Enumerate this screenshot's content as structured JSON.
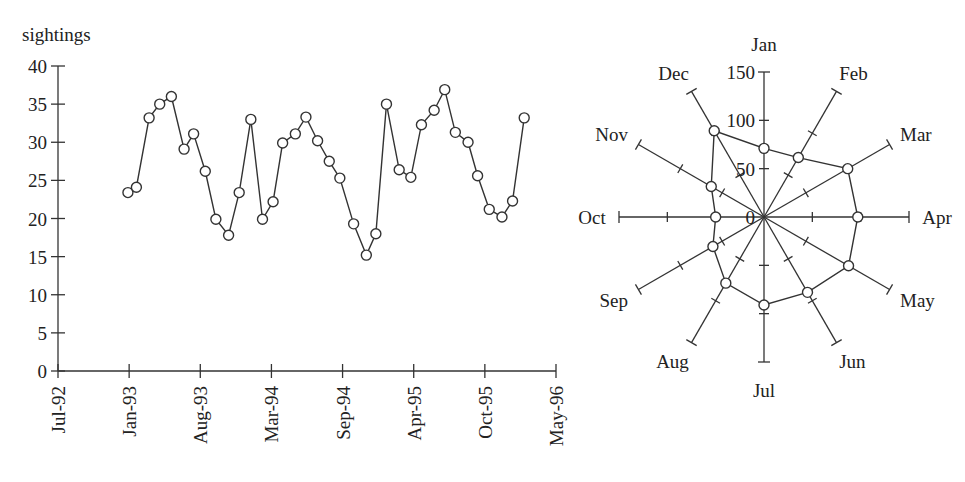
{
  "chart_data": [
    {
      "type": "line",
      "ylabel": "sightings",
      "xlabel": "",
      "title": "",
      "ylim": [
        0,
        40
      ],
      "yticks": [
        0,
        5,
        10,
        15,
        20,
        25,
        30,
        35,
        40
      ],
      "xtick_labels": [
        "Jul-92",
        "Jan-93",
        "Aug-93",
        "Mar-94",
        "Sep-94",
        "Apr-95",
        "Oct-95",
        "May-96"
      ],
      "xlim_months": [
        0,
        47
      ],
      "grid": false,
      "marker": "open-circle",
      "series": [
        {
          "name": "sightings",
          "x_months_since_jul92": [
            6.6,
            7.4,
            8.6,
            9.6,
            10.7,
            11.9,
            12.8,
            13.9,
            14.9,
            16.1,
            17.1,
            18.2,
            19.3,
            20.3,
            21.2,
            22.4,
            23.4,
            24.5,
            25.6,
            26.6,
            27.9,
            29.1,
            30.0,
            31.0,
            32.2,
            33.3,
            34.3,
            35.5,
            36.5,
            37.5,
            38.7,
            39.6,
            40.7,
            41.9,
            42.9,
            44.0
          ],
          "values": [
            23.4,
            24.1,
            33.2,
            35.0,
            36.0,
            29.1,
            31.1,
            26.2,
            19.9,
            17.8,
            23.4,
            33.0,
            19.9,
            22.2,
            29.9,
            31.1,
            33.3,
            30.2,
            27.5,
            25.3,
            19.3,
            15.2,
            18.0,
            35.0,
            26.4,
            25.4,
            32.3,
            34.2,
            36.9,
            31.3,
            30.0,
            25.6,
            21.2,
            20.2,
            22.3,
            33.2
          ]
        }
      ]
    },
    {
      "type": "radar",
      "title": "",
      "categories": [
        "Jan",
        "Feb",
        "Mar",
        "Apr",
        "May",
        "Jun",
        "Jul",
        "Aug",
        "Sep",
        "Oct",
        "Nov",
        "Dec"
      ],
      "values": [
        71,
        71,
        100,
        97,
        101,
        90,
        91,
        79,
        61,
        50,
        63,
        103
      ],
      "rlim": [
        0,
        150
      ],
      "rticks": [
        0,
        50,
        100,
        150
      ],
      "rtick_labels": [
        "0",
        "50",
        "100",
        "150"
      ],
      "marker": "open-circle",
      "grid": false
    }
  ]
}
